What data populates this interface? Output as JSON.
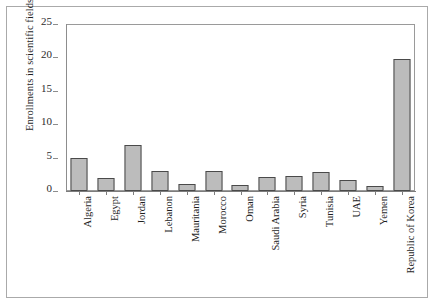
{
  "chart_data": {
    "type": "bar",
    "title": "",
    "xlabel": "",
    "ylabel": "Enrollments in scientific fields (%)",
    "ylim": [
      0,
      25
    ],
    "yticks": [
      0,
      5,
      10,
      15,
      20,
      25
    ],
    "grid": false,
    "legend": null,
    "bar_color": "#bcbcbc",
    "bar_edge_color": "#4a4a4a",
    "categories": [
      "Algeria",
      "Egypt",
      "Jordan",
      "Lebanon",
      "Mauritania",
      "Morocco",
      "Oman",
      "Saudi Arabia",
      "Syria",
      "Tunisia",
      "UAE",
      "Yemen",
      "Republic of Korea"
    ],
    "values": [
      5.0,
      2.0,
      6.9,
      3.0,
      1.1,
      3.0,
      0.9,
      2.1,
      2.2,
      2.8,
      1.7,
      0.7,
      19.8
    ]
  }
}
